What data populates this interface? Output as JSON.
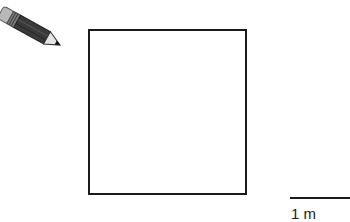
{
  "figure": {
    "icon": "pencil-icon",
    "shape": "square",
    "scale_bar": {
      "label": "1 m"
    }
  },
  "colors": {
    "outline": "#1a1a1a",
    "pencil_body": "#3a3a3a",
    "pencil_eraser": "#b8b8b8",
    "pencil_wood": "#e6e6e6",
    "background": "#ffffff"
  }
}
